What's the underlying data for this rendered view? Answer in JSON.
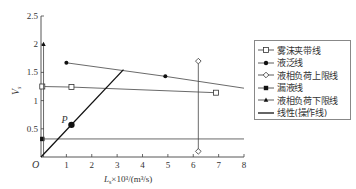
{
  "chart_data": {
    "type": "line",
    "title": "",
    "xlabel": "Ls×10³/(m³/s)",
    "ylabel": "Vs",
    "xlim": [
      0,
      8
    ],
    "ylim": [
      0,
      2.5
    ],
    "x_ticks": [
      "1",
      "2",
      "3",
      "4",
      "5",
      "6",
      "7",
      "8"
    ],
    "y_ticks": [
      "0.5",
      "1",
      "1.5",
      "2",
      "2.5"
    ],
    "origin_label": "O",
    "grid": false,
    "legend_position": "right",
    "series": [
      {
        "name": "雾沫夹带线",
        "marker": "square-open",
        "x": [
          0.05,
          1.2,
          6.9
        ],
        "y": [
          1.25,
          1.24,
          1.14
        ]
      },
      {
        "name": "液泛线",
        "marker": "circle-filled",
        "x": [
          1.0,
          4.9,
          8.0
        ],
        "y": [
          1.67,
          1.43,
          1.22
        ]
      },
      {
        "name": "液相负荷上限线",
        "marker": "diamond-open",
        "x": [
          6.2,
          6.2
        ],
        "y": [
          0.1,
          1.7
        ]
      },
      {
        "name": "漏液线",
        "marker": "square-filled",
        "x": [
          0.05,
          8.0
        ],
        "y": [
          0.32,
          0.32
        ]
      },
      {
        "name": "液相负荷下限线",
        "marker": "triangle-filled",
        "x": [
          0.1,
          0.1
        ],
        "y": [
          0.0,
          2.0
        ]
      },
      {
        "name": "线性(操作线)",
        "marker": "none",
        "x": [
          0.0,
          3.25
        ],
        "y": [
          0.0,
          1.55
        ]
      }
    ],
    "annotations": [
      {
        "label": "P",
        "x": 1.2,
        "y": 0.57,
        "marker": "circle-filled-large"
      }
    ]
  },
  "legend": {
    "items": [
      {
        "label": "雾沫夹带线"
      },
      {
        "label": "液泛线"
      },
      {
        "label": "液相负荷上限线"
      },
      {
        "label": "漏液线"
      },
      {
        "label": "液相负荷下限线"
      },
      {
        "label": "线性(操作线)"
      }
    ]
  },
  "axes": {
    "x_label_main": "L",
    "x_label_sub": "s",
    "x_label_rest": "×10³/(m³/s)",
    "y_label_main": "V",
    "y_label_sub": "s",
    "origin": "O",
    "point_label": "P"
  }
}
